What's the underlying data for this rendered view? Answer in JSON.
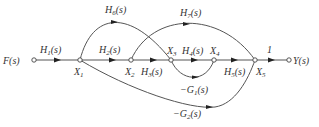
{
  "diagram": {
    "type": "signal-flow-graph",
    "input": {
      "label": "F(s)"
    },
    "output": {
      "label": "Y(s)"
    },
    "nodes": [
      {
        "id": "F",
        "label": "F(s)"
      },
      {
        "id": "X1",
        "label": "X",
        "sub": "1"
      },
      {
        "id": "X2",
        "label": "X",
        "sub": "2"
      },
      {
        "id": "X3",
        "label": "X",
        "sub": "3"
      },
      {
        "id": "X4",
        "label": "X",
        "sub": "4"
      },
      {
        "id": "X5",
        "label": "X",
        "sub": "5"
      },
      {
        "id": "Y",
        "label": "Y(s)"
      }
    ],
    "edges": [
      {
        "from": "F",
        "to": "X1",
        "gain": "H",
        "sub": "1",
        "arg": "(s)"
      },
      {
        "from": "X1",
        "to": "X2",
        "gain": "H",
        "sub": "2",
        "arg": "(s)"
      },
      {
        "from": "X2",
        "to": "X3",
        "gain": "H",
        "sub": "3",
        "arg": "(s)"
      },
      {
        "from": "X3",
        "to": "X4",
        "gain": "H",
        "sub": "4",
        "arg": "(s)"
      },
      {
        "from": "X4",
        "to": "X5",
        "gain": "H",
        "sub": "5",
        "arg": "(s)"
      },
      {
        "from": "X5",
        "to": "Y",
        "gain": "1"
      },
      {
        "from": "X1",
        "to": "X3",
        "gain": "H",
        "sub": "6",
        "arg": "(s)"
      },
      {
        "from": "X2",
        "to": "X5",
        "gain": "H",
        "sub": "7",
        "arg": "(s)"
      },
      {
        "from": "X3",
        "to": "X4",
        "gain": "−G",
        "sub": "1",
        "arg": "(s)"
      },
      {
        "from": "X1",
        "to": "X5",
        "gain": "−G",
        "sub": "2",
        "arg": "(s)"
      }
    ]
  }
}
